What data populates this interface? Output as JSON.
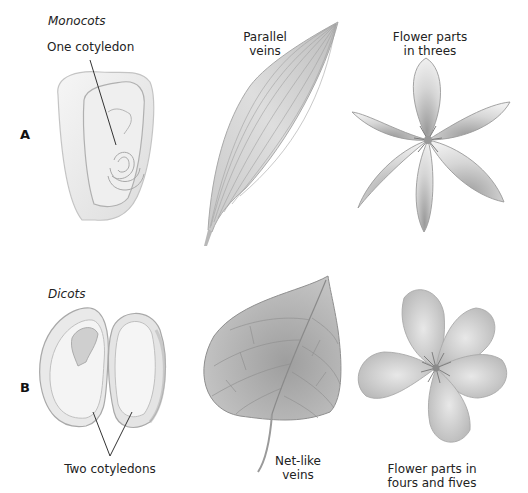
{
  "figure": {
    "row_a": {
      "marker": "A",
      "group_title": "Monocots",
      "seed_label": "One cotyledon",
      "leaf_label_line1": "Parallel",
      "leaf_label_line2": "veins",
      "flower_label_line1": "Flower parts",
      "flower_label_line2": "in threes"
    },
    "row_b": {
      "marker": "B",
      "group_title": "Dicots",
      "seed_label": "Two cotyledons",
      "leaf_label_line1": "Net-like",
      "leaf_label_line2": "veins",
      "flower_label_line1": "Flower parts in",
      "flower_label_line2": "fours and fives"
    },
    "colors": {
      "background": "#ffffff",
      "ink": "#222222",
      "illustration_light": "#ececec",
      "illustration_mid": "#bdbdbd",
      "illustration_dark": "#8a8a8a"
    }
  }
}
